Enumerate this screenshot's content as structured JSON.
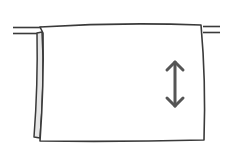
{
  "illustration": {
    "subject": "towel-on-rail",
    "icon": "vertical-double-arrow-icon",
    "colors": {
      "stroke": "#3a3a3a",
      "arrow": "#555555",
      "fold_fill": "#e6e6e6",
      "background": "#ffffff"
    }
  }
}
